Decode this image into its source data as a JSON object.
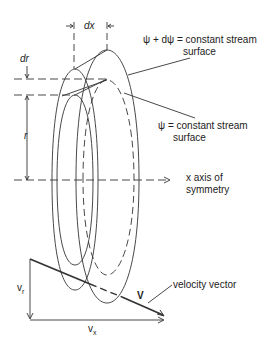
{
  "diagram": {
    "labels": {
      "dx": "dx",
      "dr": "dr",
      "r": "r",
      "outer_surface_line1": "ψ + dψ = constant stream",
      "outer_surface_line2": "surface",
      "inner_surface_line1": "ψ = constant stream",
      "inner_surface_line2": "surface",
      "axis_line1": "x axis of",
      "axis_line2": "symmetry",
      "velocity_vector": "velocity vector",
      "V": "V",
      "vr": "v",
      "vr_sub": "r",
      "vx": "v",
      "vx_sub": "x"
    },
    "colors": {
      "line": "#333333",
      "text": "#222222"
    }
  }
}
